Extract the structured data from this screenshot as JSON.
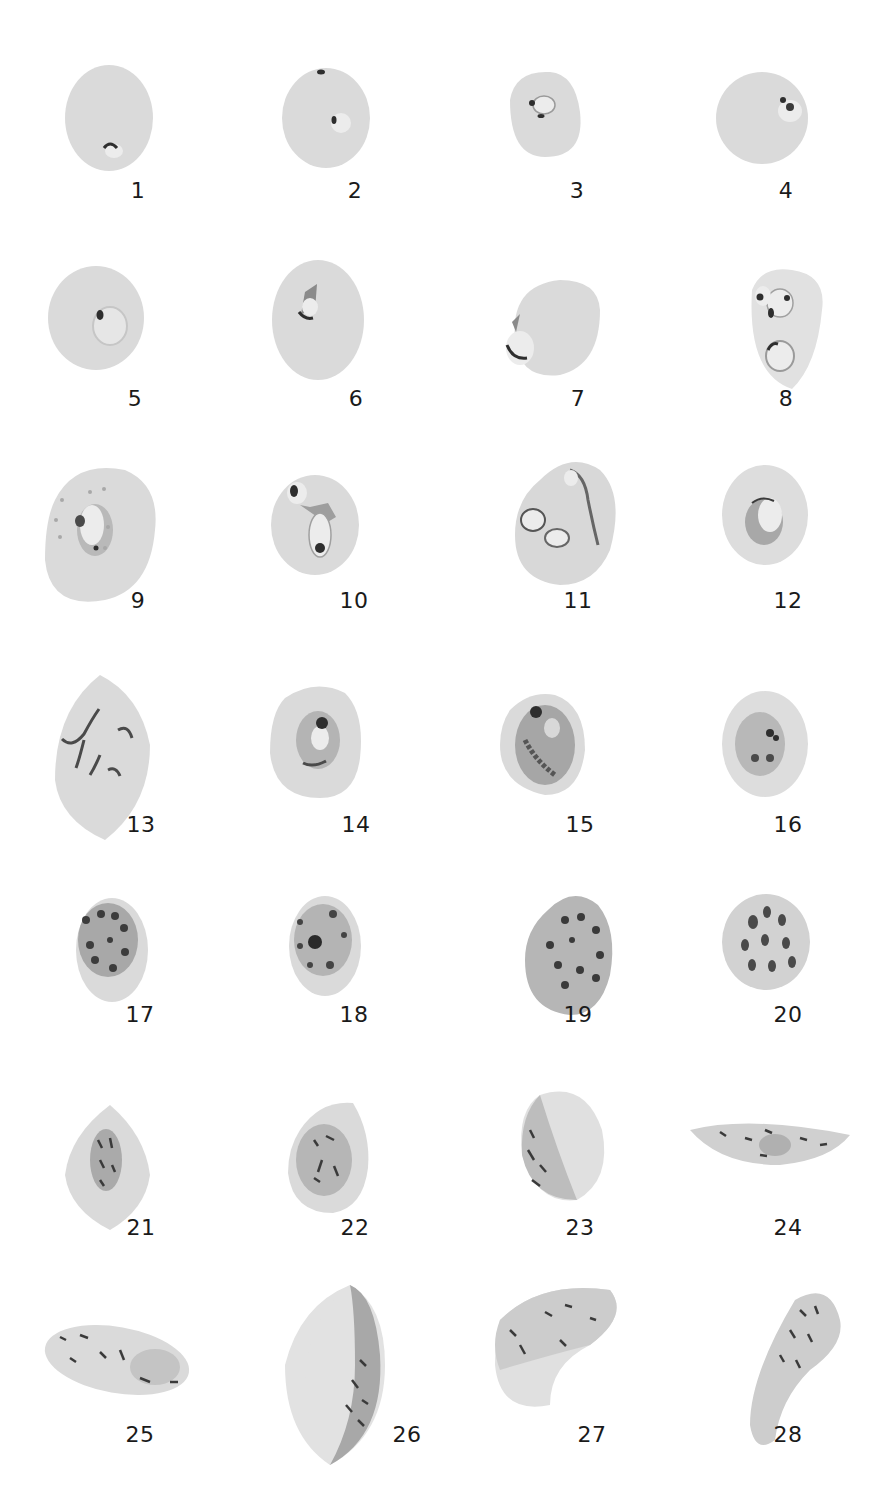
{
  "plate": {
    "background": "#ffffff",
    "cell_color": "#dcdcdc",
    "cell_shade": "#cfcfcf",
    "parasite_dark": "#2e2e2e",
    "parasite_mid": "#8a8a8a",
    "vacuole": "#ececec"
  },
  "figures": [
    {
      "num": "1",
      "label_x": 138,
      "label_y": 178
    },
    {
      "num": "2",
      "label_x": 355,
      "label_y": 178
    },
    {
      "num": "3",
      "label_x": 577,
      "label_y": 178
    },
    {
      "num": "4",
      "label_x": 786,
      "label_y": 178
    },
    {
      "num": "5",
      "label_x": 135,
      "label_y": 386
    },
    {
      "num": "6",
      "label_x": 356,
      "label_y": 386
    },
    {
      "num": "7",
      "label_x": 578,
      "label_y": 386
    },
    {
      "num": "8",
      "label_x": 786,
      "label_y": 386
    },
    {
      "num": "9",
      "label_x": 138,
      "label_y": 588
    },
    {
      "num": "10",
      "label_x": 354,
      "label_y": 588
    },
    {
      "num": "11",
      "label_x": 578,
      "label_y": 588
    },
    {
      "num": "12",
      "label_x": 788,
      "label_y": 588
    },
    {
      "num": "13",
      "label_x": 141,
      "label_y": 812
    },
    {
      "num": "14",
      "label_x": 356,
      "label_y": 812
    },
    {
      "num": "15",
      "label_x": 580,
      "label_y": 812
    },
    {
      "num": "16",
      "label_x": 788,
      "label_y": 812
    },
    {
      "num": "17",
      "label_x": 140,
      "label_y": 1002
    },
    {
      "num": "18",
      "label_x": 354,
      "label_y": 1002
    },
    {
      "num": "19",
      "label_x": 578,
      "label_y": 1002
    },
    {
      "num": "20",
      "label_x": 788,
      "label_y": 1002
    },
    {
      "num": "21",
      "label_x": 141,
      "label_y": 1215
    },
    {
      "num": "22",
      "label_x": 355,
      "label_y": 1215
    },
    {
      "num": "23",
      "label_x": 580,
      "label_y": 1215
    },
    {
      "num": "24",
      "label_x": 788,
      "label_y": 1215
    },
    {
      "num": "25",
      "label_x": 140,
      "label_y": 1422
    },
    {
      "num": "26",
      "label_x": 407,
      "label_y": 1422
    },
    {
      "num": "27",
      "label_x": 592,
      "label_y": 1422
    },
    {
      "num": "28",
      "label_x": 788,
      "label_y": 1422
    }
  ]
}
